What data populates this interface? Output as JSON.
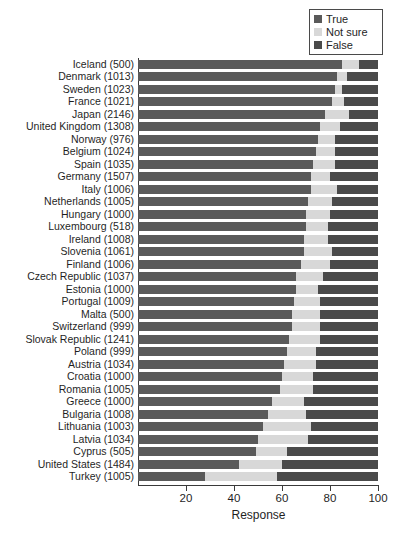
{
  "chart_data": {
    "type": "bar",
    "orientation": "horizontal",
    "stacked": true,
    "stack_mode": "percent",
    "title": "",
    "subtitle": "",
    "xlabel": "Response",
    "ylabel": "",
    "xlim": [
      0,
      100
    ],
    "xticks": [
      20,
      40,
      60,
      80,
      100
    ],
    "grid": false,
    "legend_position": "top-right",
    "legend": [
      "True",
      "Not sure",
      "False"
    ],
    "colors": {
      "True": "#5a5a5a",
      "Not sure": "#d8d8d8",
      "False": "#4a4a4a",
      "axis": "#3a3a3a",
      "background": "#ffffff",
      "text": "#1f1f1f"
    },
    "categories": [
      "Iceland (500)",
      "Denmark (1013)",
      "Sweden (1023)",
      "France (1021)",
      "Japan (2146)",
      "United Kingdom (1308)",
      "Norway (976)",
      "Belgium (1024)",
      "Spain (1035)",
      "Germany (1507)",
      "Italy (1006)",
      "Netherlands (1005)",
      "Hungary (1000)",
      "Luxembourg (518)",
      "Ireland (1008)",
      "Slovenia (1061)",
      "Finland (1006)",
      "Czech Republic (1037)",
      "Estonia (1000)",
      "Portugal (1009)",
      "Malta (500)",
      "Switzerland (999)",
      "Slovak Republic (1241)",
      "Poland (999)",
      "Austria (1034)",
      "Croatia (1000)",
      "Romania (1005)",
      "Greece (1000)",
      "Bulgaria (1008)",
      "Lithuania (1003)",
      "Latvia (1034)",
      "Cyprus (505)",
      "United States (1484)",
      "Turkey (1005)"
    ],
    "series": [
      {
        "name": "True",
        "values": [
          85,
          83,
          82,
          81,
          78,
          76,
          75,
          74,
          73,
          72,
          72,
          71,
          70,
          70,
          69,
          69,
          68,
          66,
          66,
          65,
          64,
          64,
          63,
          62,
          61,
          60,
          59,
          56,
          54,
          52,
          50,
          49,
          42,
          28
        ]
      },
      {
        "name": "Not sure",
        "values": [
          7,
          4,
          3,
          5,
          10,
          8,
          7,
          8,
          9,
          8,
          11,
          10,
          10,
          9,
          10,
          12,
          12,
          11,
          9,
          11,
          12,
          12,
          13,
          12,
          13,
          13,
          14,
          13,
          16,
          20,
          21,
          13,
          18,
          30
        ]
      },
      {
        "name": "False",
        "values": [
          8,
          13,
          15,
          14,
          12,
          16,
          18,
          18,
          18,
          20,
          17,
          19,
          20,
          21,
          21,
          19,
          20,
          23,
          25,
          24,
          24,
          24,
          24,
          26,
          26,
          27,
          27,
          31,
          30,
          28,
          29,
          38,
          40,
          42
        ]
      }
    ]
  },
  "legend": {
    "items": [
      {
        "label": "True",
        "color": "#5a5a5a"
      },
      {
        "label": "Not sure",
        "color": "#d8d8d8"
      },
      {
        "label": "False",
        "color": "#4a4a4a"
      }
    ]
  },
  "axis": {
    "x_title": "Response",
    "x_tick_labels": [
      "20",
      "40",
      "60",
      "80",
      "100"
    ]
  }
}
